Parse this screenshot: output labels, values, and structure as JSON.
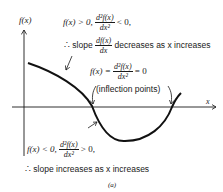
{
  "axes": {
    "y_label": "f(x)",
    "x_label": "x"
  },
  "annotations": {
    "top": {
      "condition_lhs": "f(x) > 0,",
      "frac_num": "d²f(x)",
      "frac_den": "dx²",
      "condition_rhs": "< 0,",
      "therefore": "∴ slope",
      "slope_num": "df(x)",
      "slope_den": "dx",
      "conclusion": "decreases as x increases"
    },
    "middle": {
      "lhs": "f(x) =",
      "frac_num": "d²f(x)",
      "frac_den": "dx²",
      "rhs": "= 0",
      "note": "(inflection points)"
    },
    "bottom": {
      "condition_lhs": "f(x) < 0,",
      "frac_num": "d²f(x)",
      "frac_den": "dx²",
      "condition_rhs": "> 0,",
      "conclusion": "∴ slope increases as x increases"
    }
  },
  "caption": "(a)"
}
